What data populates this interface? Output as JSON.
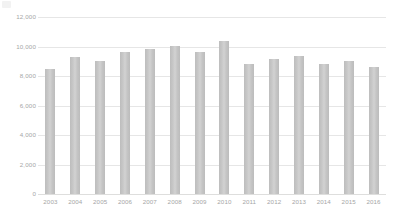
{
  "chart_data": {
    "type": "bar",
    "title": "",
    "subtitle": "",
    "xlabel": "",
    "ylabel": "",
    "categories": [
      "2003",
      "2004",
      "2005",
      "2006",
      "2007",
      "2008",
      "2009",
      "2010",
      "2011",
      "2012",
      "2013",
      "2014",
      "2015",
      "2016"
    ],
    "values": [
      8500,
      9300,
      9050,
      9600,
      9850,
      10050,
      9600,
      10400,
      8800,
      9150,
      9350,
      8800,
      9050,
      8600
    ],
    "series": [
      {
        "name": "",
        "values": [
          8500,
          9300,
          9050,
          9600,
          9850,
          10050,
          9600,
          10400,
          8800,
          9150,
          9350,
          8800,
          9050,
          8600
        ],
        "color": "#c6c6c6"
      }
    ],
    "ylim": [
      0,
      12000
    ],
    "ytick_values": [
      12000,
      10000,
      8000,
      6000,
      4000,
      2000,
      0
    ],
    "ytick_labels": [
      "12,000",
      "10,000",
      "8,000",
      "6,000",
      "4,000",
      "2,000",
      "0"
    ],
    "grid": true,
    "grid_axis": "y",
    "legend": false,
    "legend_position": "none",
    "annotations": [],
    "colors": {
      "bar": "#c6c6c6",
      "gridline": "#e6e6e6",
      "tick_label": "#a6a6a6",
      "background": "#ffffff"
    }
  }
}
